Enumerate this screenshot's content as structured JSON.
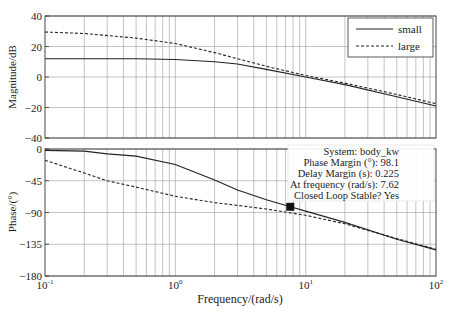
{
  "chart_data": {
    "type": "line",
    "title": "",
    "xlabel": "Frequency/(rad/s)",
    "xscale": "log",
    "xlim": [
      0.1,
      100
    ],
    "x_ticks": [
      {
        "value": 0.1,
        "base": "10",
        "exp": "-1"
      },
      {
        "value": 1,
        "base": "10",
        "exp": "0"
      },
      {
        "value": 10,
        "base": "10",
        "exp": "1"
      },
      {
        "value": 100,
        "base": "10",
        "exp": "2"
      }
    ],
    "grid": true,
    "legend": {
      "position": "upper right of magnitude plot",
      "entries": [
        {
          "name": "small",
          "style": "solid"
        },
        {
          "name": "large",
          "style": "dashed"
        }
      ]
    },
    "subplots": [
      {
        "name": "magnitude",
        "ylabel": "Magnitude/dB",
        "ylim": [
          -40,
          40
        ],
        "y_ticks": [
          "40",
          "20",
          "0",
          "−20",
          "−40"
        ],
        "y_tick_values": [
          40,
          20,
          0,
          -20,
          -40
        ],
        "series": [
          {
            "name": "small",
            "style": "solid",
            "x": [
              0.1,
              0.2,
              0.5,
              1,
              2,
              3,
              5,
              10,
              20,
              50,
              100
            ],
            "y": [
              12,
              12,
              12,
              11.5,
              10,
              8.5,
              5,
              0,
              -5,
              -13,
              -19
            ]
          },
          {
            "name": "large",
            "style": "dashed",
            "x": [
              0.1,
              0.2,
              0.5,
              1,
              2,
              3,
              5,
              10,
              20,
              50,
              100
            ],
            "y": [
              29.5,
              28.5,
              25.5,
              22,
              16,
              12,
              7,
              1,
              -4,
              -11.5,
              -17.5
            ]
          }
        ]
      },
      {
        "name": "phase",
        "ylabel": "Phase/(°)",
        "ylim": [
          -180,
          0
        ],
        "y_ticks": [
          "0",
          "−45",
          "−90",
          "−135",
          "−180"
        ],
        "y_tick_values": [
          0,
          -45,
          -90,
          -135,
          -180
        ],
        "series": [
          {
            "name": "small",
            "style": "solid",
            "x": [
              0.1,
              0.2,
              0.3,
              0.5,
              1,
              2,
              3,
              5,
              7.62,
              10,
              20,
              50,
              100
            ],
            "y": [
              -2,
              -3,
              -7,
              -10,
              -22,
              -44,
              -58,
              -72,
              -81.9,
              -88,
              -104,
              -128,
              -143
            ]
          },
          {
            "name": "large",
            "style": "dashed",
            "x": [
              0.1,
              0.2,
              0.3,
              0.5,
              1,
              2,
              3,
              5,
              10,
              20,
              50,
              100
            ],
            "y": [
              -16,
              -34,
              -45,
              -54,
              -67,
              -76,
              -80,
              -85,
              -94,
              -106,
              -127,
              -142
            ]
          }
        ]
      }
    ],
    "annotation": {
      "marker": {
        "x": 7.62,
        "y": -81.9,
        "shape": "square"
      },
      "lines": [
        "System: body_kw",
        "Phase Margin (°): 98.1",
        "Delay Margin (s): 0.225",
        "At frequency (rad/s): 7.62",
        "Closed Loop Stable? Yes"
      ]
    }
  }
}
